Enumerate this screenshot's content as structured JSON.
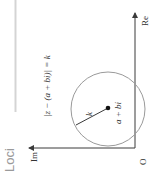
{
  "section": {
    "title": "Loci"
  },
  "diagram": {
    "equation": "|z − (a + bi)| = k",
    "center_label": "a + bi",
    "radius_label": "k",
    "axes": {
      "real": "Re",
      "imaginary": "Im",
      "origin": "O"
    }
  },
  "colors": {
    "axis": "#3a3a3a",
    "circle": "#9a9a9a",
    "divider": "#d4d4d4",
    "title": "#9a9a9a",
    "text": "#333333"
  }
}
